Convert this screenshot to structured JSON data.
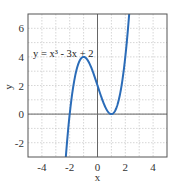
{
  "chart_data": {
    "type": "line",
    "title": "",
    "xlabel": "x",
    "ylabel": "y",
    "xlim": [
      -5,
      5
    ],
    "ylim": [
      -3,
      7
    ],
    "xticks": [
      -4,
      -2,
      0,
      2,
      4
    ],
    "yticks": [
      -2,
      0,
      2,
      4,
      6
    ],
    "grid": true,
    "annotation": "y = x³ - 3x + 2",
    "series": [
      {
        "name": "y = x^3 - 3x + 2",
        "color": "#2b6cb8",
        "x": [
          -2.3,
          -2.2,
          -2.1,
          -2.0,
          -1.8,
          -1.6,
          -1.4,
          -1.2,
          -1.0,
          -0.8,
          -0.6,
          -0.4,
          -0.2,
          0.0,
          0.2,
          0.4,
          0.6,
          0.8,
          1.0,
          1.2,
          1.4,
          1.6,
          1.8,
          2.0,
          2.2,
          2.35
        ],
        "y": [
          -3.267,
          -2.048,
          -0.961,
          0.0,
          1.568,
          2.704,
          3.456,
          3.872,
          4.0,
          3.888,
          3.584,
          3.136,
          2.592,
          2.0,
          1.408,
          0.864,
          0.416,
          0.112,
          0.0,
          0.128,
          0.544,
          1.296,
          2.432,
          4.0,
          6.048,
          7.928
        ]
      }
    ]
  },
  "labels": {
    "xlabel": "x",
    "ylabel": "y",
    "annotation": "y = x³ - 3x + 2",
    "xticks": [
      "-4",
      "-2",
      "0",
      "2",
      "4"
    ],
    "yticks": [
      "6",
      "4",
      "2",
      "0",
      "-2"
    ]
  }
}
